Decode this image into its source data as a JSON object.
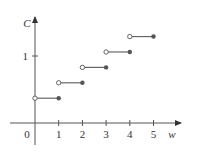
{
  "chart_data": {
    "type": "line",
    "subtype": "step-function",
    "title": "",
    "xlabel": "w",
    "ylabel": "C",
    "x_ticks": [
      "0",
      "1",
      "2",
      "3",
      "4",
      "5"
    ],
    "y_ticks": [
      "1"
    ],
    "xlim": [
      0,
      5.5
    ],
    "ylim": [
      0,
      1.5
    ],
    "grid": false,
    "legend": null,
    "steps": [
      {
        "x_start": 0,
        "x_end": 1,
        "y": 0.37,
        "open_left": true,
        "closed_right": true
      },
      {
        "x_start": 1,
        "x_end": 2,
        "y": 0.6,
        "open_left": true,
        "closed_right": true
      },
      {
        "x_start": 2,
        "x_end": 3,
        "y": 0.83,
        "open_left": true,
        "closed_right": true
      },
      {
        "x_start": 3,
        "x_end": 4,
        "y": 1.06,
        "open_left": true,
        "closed_right": true
      },
      {
        "x_start": 4,
        "x_end": 5,
        "y": 1.29,
        "open_left": true,
        "closed_right": true
      }
    ]
  },
  "axes": {
    "x_label": "w",
    "y_label": "C",
    "origin_label": "0",
    "x_tick_labels": [
      "1",
      "2",
      "3",
      "4",
      "5"
    ],
    "y_tick_labels": [
      "1"
    ]
  },
  "colors": {
    "axis": "#555555",
    "step_line": "#666666",
    "closed_dot": "#555555",
    "open_dot_fill": "#ffffff"
  }
}
